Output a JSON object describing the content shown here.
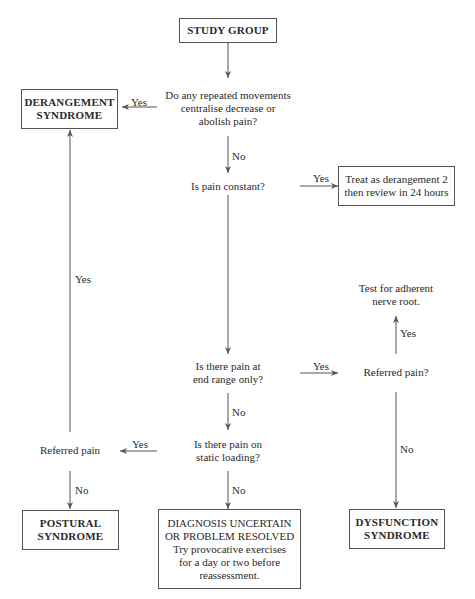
{
  "diagram": {
    "nodes": {
      "study_group": "STUDY GROUP",
      "q_repeated": [
        "Do any repeated movements",
        "centralise decrease or",
        "abolish pain?"
      ],
      "derangement": [
        "DERANGEMENT",
        "SYNDROME"
      ],
      "q_constant": "Is pain constant?",
      "treat_derangement": [
        "Treat as derangement 2",
        "then review in 24 hours"
      ],
      "test_nerve": [
        "Test for adherent",
        "nerve root."
      ],
      "q_end_range": [
        "Is there pain at",
        "end range only?"
      ],
      "q_referred_right": "Referred pain?",
      "referred_left": "Referred pain",
      "q_static": [
        "Is there pain on",
        "static loading?"
      ],
      "postural": [
        "POSTURAL",
        "SYNDROME"
      ],
      "uncertain": [
        "DIAGNOSIS UNCERTAIN",
        "OR PROBLEM RESOLVED",
        "Try provocative exercises",
        "for a day or two before",
        "reassessment."
      ],
      "dysfunction": [
        "DYSFUNCTION",
        "SYNDROME"
      ]
    },
    "edge_labels": {
      "repeated_yes": "Yes",
      "repeated_no": "No",
      "constant_yes": "Yes",
      "referred_left_yes_up": "Yes",
      "endrange_yes": "Yes",
      "referred_right_yes": "Yes",
      "endrange_no": "No",
      "static_yes": "Yes",
      "static_no": "No",
      "referred_left_no": "No",
      "referred_right_no": "No"
    }
  }
}
